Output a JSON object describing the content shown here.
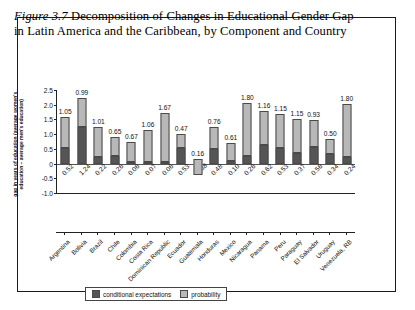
{
  "title": {
    "figure_number": "Figure 3.7",
    "text": " Decomposition of Changes in Educational Gender Gap in Latin America and the Caribbean, by Component and Country"
  },
  "chart_data": {
    "type": "bar",
    "stacked": true,
    "title": "Decomposition of Changes in Educational Gender Gap in Latin America and the Caribbean, by Component and Country",
    "xlabel": "",
    "ylabel": "gap in years of education (average women's education – average men's education)",
    "ylim": [
      -1.0,
      2.5
    ],
    "yticks": [
      "2.5",
      "2.0",
      "1.5",
      "1.0",
      "0.5",
      "0",
      "-0.5",
      "-1.0"
    ],
    "ytick_values": [
      2.5,
      2.0,
      1.5,
      1.0,
      0.5,
      0,
      -0.5,
      -1.0
    ],
    "grid": false,
    "legend_position": "bottom",
    "categories": [
      "Argentina",
      "Bolivia",
      "Brazil",
      "Chile",
      "Colombia",
      "Costa Rica",
      "Dominican Republic",
      "Ecuador",
      "Guatemala",
      "Honduras",
      "Mexico",
      "Nicaragua",
      "Panama",
      "Peru",
      "Paraguay",
      "El Salvador",
      "Uruguay",
      "Venezuela, RB"
    ],
    "series": [
      {
        "name": "conditional expectations",
        "color": "#555555",
        "values": [
          0.52,
          1.24,
          0.22,
          0.26,
          0.06,
          0.07,
          0.06,
          0.53,
          -0.38,
          0.48,
          0.1,
          0.26,
          0.62,
          0.53,
          0.37,
          0.56,
          0.34,
          0.24
        ]
      },
      {
        "name": "probability",
        "color": "#b8b8b8",
        "values": [
          1.05,
          0.99,
          1.01,
          0.65,
          0.67,
          1.06,
          1.67,
          0.47,
          0.16,
          0.76,
          0.61,
          1.8,
          1.16,
          1.15,
          1.15,
          0.93,
          0.5,
          1.8
        ]
      }
    ],
    "top_labels": [
      "1.05",
      "0.99",
      "1.01",
      "0.65",
      "0.67",
      "1.06",
      "1.67",
      "0.47",
      "0.16",
      "0.76",
      "0.61",
      "1.80",
      "1.16",
      "1.15",
      "1.15",
      "0.93",
      "0.50",
      "1.80"
    ],
    "bottom_labels": [
      "0.52",
      "1.24",
      "0.22",
      "0.26",
      "0.06",
      "0.07",
      "0.06",
      "0.53",
      "-0.38",
      "0.48",
      "0.10",
      "0.26",
      "0.62",
      "0.53",
      "0.37",
      "0.56",
      "0.34",
      "0.24"
    ],
    "legend": [
      {
        "label": "conditional expectations",
        "color": "#555555"
      },
      {
        "label": "probability",
        "color": "#b8b8b8"
      }
    ]
  }
}
